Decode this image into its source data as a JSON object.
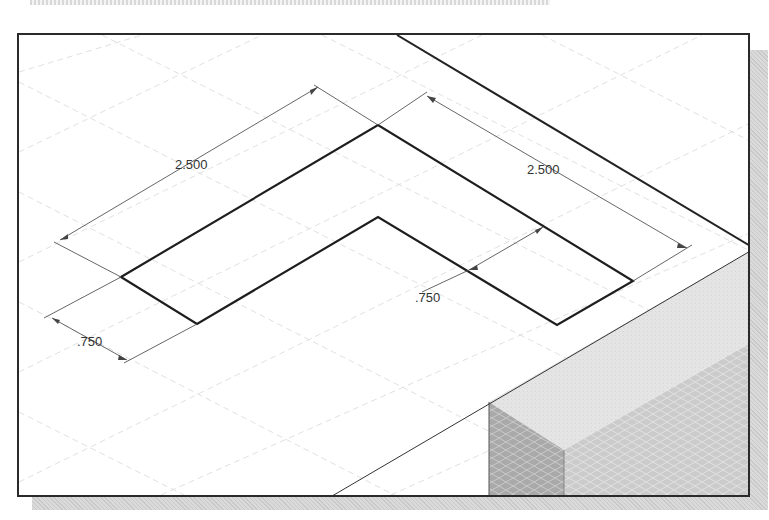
{
  "viewport": {
    "type": "isometric CAD sketch",
    "grid": "isometric dashed grid"
  },
  "dimensions": [
    {
      "id": "dim-left-length",
      "label": "2.500",
      "x": 188,
      "y": 163
    },
    {
      "id": "dim-right-length",
      "label": "2.500",
      "x": 541,
      "y": 170
    },
    {
      "id": "dim-inner-width",
      "label": ".750",
      "x": 426,
      "y": 297
    },
    {
      "id": "dim-left-width",
      "label": ".750",
      "x": 89,
      "y": 341
    }
  ],
  "colors": {
    "sketch_line": "#1e1e1e",
    "dimension_line": "#555555",
    "grid_line": "#d6d6d6",
    "solid_top_face": "#e6e6e6",
    "solid_front_face": "#b4b4b4",
    "solid_side_face": "#cfcfcf",
    "shadow": "#cccccc"
  }
}
